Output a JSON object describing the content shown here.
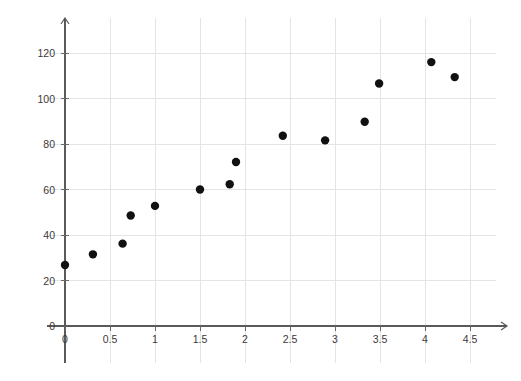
{
  "chart_data": {
    "type": "scatter",
    "title": "",
    "subtitle": "",
    "xlabel": "",
    "ylabel": "",
    "grid": true,
    "legend": null,
    "xlim": [
      -0.35,
      4.85
    ],
    "ylim": [
      -6,
      131
    ],
    "xticks": [
      0,
      0.5,
      1,
      1.5,
      2,
      2.5,
      3,
      3.5,
      4,
      4.5
    ],
    "xtick_labels": [
      "0",
      "0.5",
      "1",
      "1.5",
      "2",
      "2.5",
      "3",
      "3.5",
      "4",
      "4.5"
    ],
    "yticks": [
      0,
      20,
      40,
      60,
      80,
      100,
      120
    ],
    "ytick_labels": [
      "0",
      "20",
      "40",
      "60",
      "80",
      "100",
      "120"
    ],
    "marker": "circle",
    "marker_color": "#111111",
    "marker_size": 4.2,
    "x": [
      0.0,
      0.31,
      0.64,
      0.73,
      1.0,
      1.5,
      1.83,
      1.9,
      2.42,
      2.89,
      3.33,
      3.49,
      4.07,
      4.33
    ],
    "y": [
      26.8,
      31.5,
      36.2,
      48.6,
      52.8,
      60.0,
      62.3,
      72.1,
      83.6,
      81.6,
      89.8,
      106.6,
      116.0,
      109.4
    ],
    "points": [
      {
        "x": 0.0,
        "y": 26.8
      },
      {
        "x": 0.31,
        "y": 31.5
      },
      {
        "x": 0.64,
        "y": 36.2
      },
      {
        "x": 0.73,
        "y": 48.6
      },
      {
        "x": 1.0,
        "y": 52.8
      },
      {
        "x": 1.5,
        "y": 60.0
      },
      {
        "x": 1.83,
        "y": 62.3
      },
      {
        "x": 1.9,
        "y": 72.1
      },
      {
        "x": 2.42,
        "y": 83.6
      },
      {
        "x": 2.89,
        "y": 81.6
      },
      {
        "x": 3.33,
        "y": 89.8
      },
      {
        "x": 3.49,
        "y": 106.6
      },
      {
        "x": 4.07,
        "y": 116.0
      },
      {
        "x": 4.33,
        "y": 109.4
      }
    ]
  },
  "axes": {
    "x_axis_color": "#5a5a5a",
    "y_axis_color": "#5a5a5a",
    "grid_color": "#e4e4e4",
    "tick_color": "#6a6a6a",
    "label_color": "#3a3a3a"
  },
  "geometry": {
    "origin_x_px": 65,
    "origin_y_px": 326,
    "x_unit_px": 90,
    "y_unit_px": 2.275,
    "x_axis_end_px": 507,
    "y_axis_top_px": 18,
    "grid_top_px": 18,
    "grid_bottom_px": 363,
    "grid_left_px": 47,
    "grid_right_px": 496
  }
}
